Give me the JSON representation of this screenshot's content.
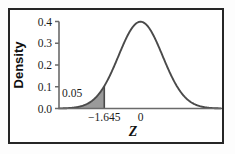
{
  "figure": {
    "frame_color": "#262626",
    "background_color": "#ffffff"
  },
  "chart_data": {
    "type": "area",
    "title": "",
    "subtitle": "",
    "xlabel": "Z",
    "ylabel": "Density",
    "xlim": [
      -3.7,
      3.65
    ],
    "ylim": [
      0.0,
      0.42
    ],
    "grid": false,
    "legend": null,
    "curve": {
      "name": "standard normal density",
      "distribution": "normal",
      "mean": 0,
      "sd": 1,
      "peak_x": 0,
      "peak_y": 0.4,
      "line_color": "#4a4a4a",
      "x": [
        -3.7,
        -3.4,
        -3.1,
        -2.8,
        -2.5,
        -2.2,
        -1.9,
        -1.645,
        -1.4,
        -1.1,
        -0.8,
        -0.5,
        -0.2,
        0,
        0.2,
        0.5,
        0.8,
        1.1,
        1.4,
        1.645,
        1.9,
        2.2,
        2.5,
        2.8,
        3.1,
        3.4,
        3.65
      ],
      "y": [
        0.0004,
        0.0012,
        0.0033,
        0.0079,
        0.0175,
        0.0355,
        0.0656,
        0.1031,
        0.1497,
        0.2179,
        0.2897,
        0.3521,
        0.391,
        0.3989,
        0.391,
        0.3521,
        0.2897,
        0.2179,
        0.1497,
        0.1031,
        0.0656,
        0.0355,
        0.0175,
        0.0079,
        0.0033,
        0.0012,
        0.0005
      ]
    },
    "shaded_region": {
      "label": "0.05",
      "area": 0.05,
      "from_x": -3.7,
      "to_x": -1.645,
      "fill_color": "#9a9a9a",
      "edge_color": "#4a4a4a",
      "description": "left tail area below z = -1.645"
    },
    "x_ticks": [
      {
        "value": -1.645,
        "label": "−1.645"
      },
      {
        "value": 0,
        "label": "0"
      }
    ],
    "y_ticks": [
      {
        "value": 0.0,
        "label": "0.0"
      },
      {
        "value": 0.1,
        "label": "0.1"
      },
      {
        "value": 0.2,
        "label": "0.2"
      },
      {
        "value": 0.3,
        "label": "0.3"
      },
      {
        "value": 0.4,
        "label": "0.4"
      }
    ]
  }
}
